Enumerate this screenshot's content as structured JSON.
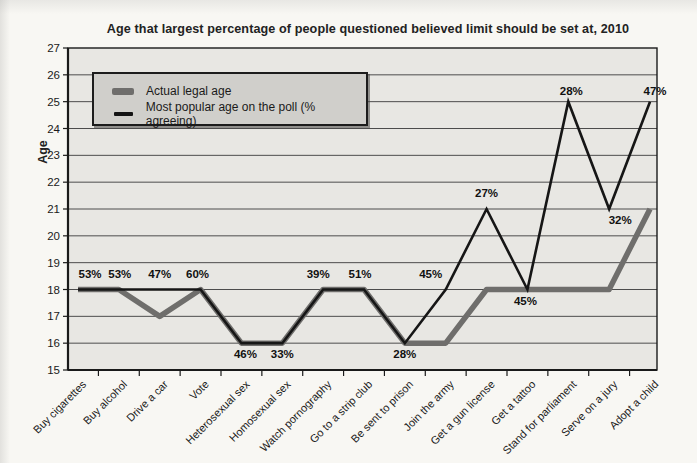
{
  "chart": {
    "title": "Age that largest percentage of people questioned believed limit should be set at, 2010",
    "y_axis_label": "Age",
    "legend": [
      {
        "swatch": "thick-gray-line",
        "label": "Actual legal age"
      },
      {
        "swatch": "thin-black-line",
        "label": "Most popular age on the poll (% agreeing)"
      }
    ],
    "colors": {
      "actual_line": "#6f6e6c",
      "poll_line": "#161616",
      "plot_bg": "#e8e7e3",
      "grid": "#4c4c4c",
      "axis": "#1a1a1a",
      "legend_bg": "#d0cfcb"
    }
  },
  "chart_data": {
    "type": "line",
    "title": "Age that largest percentage of people questioned believed limit should be set at, 2010",
    "xlabel": "",
    "ylabel": "Age",
    "ylim": [
      15,
      27
    ],
    "y_ticks": [
      15,
      16,
      17,
      18,
      19,
      20,
      21,
      22,
      23,
      24,
      25,
      26,
      27
    ],
    "grid": "horizontal",
    "legend_position": "top-left-inside",
    "categories": [
      "Buy cigarettes",
      "Buy alcohol",
      "Drive a car",
      "Vote",
      "Heterosexual sex",
      "Homosexual sex",
      "Watch pornography",
      "Go to a strip club",
      "Be sent to prison",
      "Join the army",
      "Get a gun license",
      "Get a tattoo",
      "Stand for parliament",
      "Serve on a jury",
      "Adopt a child"
    ],
    "series": [
      {
        "name": "Actual legal age",
        "style": "thick-gray",
        "values": [
          18,
          18,
          17,
          18,
          16,
          16,
          18,
          18,
          16,
          16,
          18,
          18,
          18,
          18,
          21
        ]
      },
      {
        "name": "Most popular age on the poll (% agreeing)",
        "style": "thin-black",
        "values": [
          18,
          18,
          18,
          18,
          16,
          16,
          18,
          18,
          16,
          18,
          21,
          18,
          25,
          21,
          25
        ],
        "point_labels": [
          "53%",
          "53%",
          "47%",
          "60%",
          "46%",
          "33%",
          "39%",
          "51%",
          "28%",
          "45%",
          "27%",
          "45%",
          "28%",
          "32%",
          "47%"
        ]
      }
    ]
  }
}
